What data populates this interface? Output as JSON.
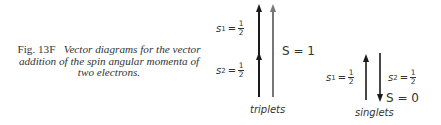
{
  "caption": {
    "figure_label": "Fig. 13F",
    "text": "Vector diagrams for the vector addition of the spin angular momenta of two electrons."
  },
  "triplets": {
    "label": "triplets",
    "s1": {
      "symbol": "s",
      "sub": "1",
      "eq": "=",
      "num": "1",
      "den": "2"
    },
    "s2": {
      "symbol": "s",
      "sub": "2",
      "eq": "=",
      "num": "1",
      "den": "2"
    },
    "total": "S = 1"
  },
  "singlets": {
    "label": "singlets",
    "s1": {
      "symbol": "s",
      "sub": "1",
      "eq": "=",
      "num": "1",
      "den": "2"
    },
    "s2": {
      "symbol": "s",
      "sub": "2",
      "eq": "=",
      "num": "1",
      "den": "2"
    },
    "total": "S = 0"
  },
  "colors": {
    "dark_arrow": "#1a1a1a",
    "gray_arrow": "#777777"
  }
}
